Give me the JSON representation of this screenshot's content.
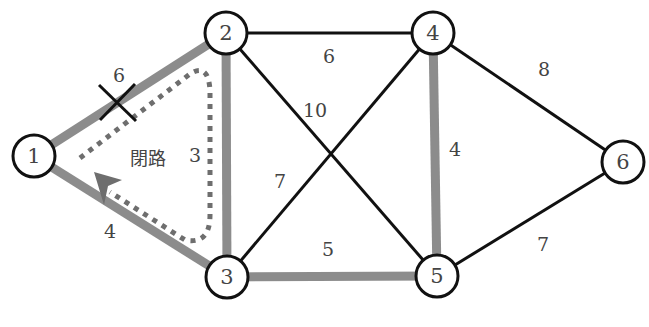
{
  "diagram": {
    "type": "weighted-graph",
    "colors": {
      "edge_default": "#111111",
      "edge_highlight": "#8c8c8c",
      "loop_path": "#6e6e6e",
      "node_stroke": "#111111",
      "node_fill": "#ffffff",
      "text": "#444444",
      "cut_mark": "#111111"
    },
    "nodes": [
      {
        "id": "1",
        "label": "1",
        "x": 34,
        "y": 156
      },
      {
        "id": "2",
        "label": "2",
        "x": 226,
        "y": 33
      },
      {
        "id": "3",
        "label": "3",
        "x": 227,
        "y": 277
      },
      {
        "id": "4",
        "label": "4",
        "x": 433,
        "y": 33
      },
      {
        "id": "5",
        "label": "5",
        "x": 437,
        "y": 276
      },
      {
        "id": "6",
        "label": "6",
        "x": 623,
        "y": 162
      }
    ],
    "edges": [
      {
        "from": "1",
        "to": "2",
        "weight": "6",
        "highlighted": true,
        "cut": true
      },
      {
        "from": "1",
        "to": "3",
        "weight": "4",
        "highlighted": true
      },
      {
        "from": "2",
        "to": "3",
        "weight": "3",
        "highlighted": true
      },
      {
        "from": "2",
        "to": "4",
        "weight": "6",
        "highlighted": false
      },
      {
        "from": "2",
        "to": "5",
        "weight": "10",
        "highlighted": false
      },
      {
        "from": "3",
        "to": "4",
        "weight": "7",
        "highlighted": false
      },
      {
        "from": "3",
        "to": "5",
        "weight": "5",
        "highlighted": true
      },
      {
        "from": "4",
        "to": "5",
        "weight": "4",
        "highlighted": true
      },
      {
        "from": "4",
        "to": "6",
        "weight": "8",
        "highlighted": false
      },
      {
        "from": "5",
        "to": "6",
        "weight": "7",
        "highlighted": false
      }
    ],
    "labels": {
      "edge_1_2": "6",
      "edge_1_3": "4",
      "edge_2_3": "3",
      "edge_2_4": "6",
      "edge_2_5": "10",
      "edge_3_4": "7",
      "edge_3_5": "5",
      "edge_4_5": "4",
      "edge_4_6": "8",
      "edge_5_6": "7",
      "loop": "閉路",
      "cut_mark": "×"
    }
  }
}
